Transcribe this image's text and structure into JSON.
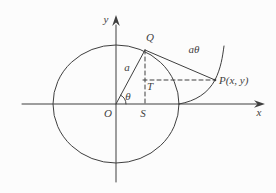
{
  "figure": {
    "background": "#fcfcfc",
    "ink_color": "#3f3f3f",
    "labels": {
      "y_axis": "y",
      "x_axis": "x",
      "point_Q": "Q",
      "arc_length": "aθ",
      "radius": "a",
      "angle": "θ",
      "origin": "O",
      "point_S": "S",
      "point_T": "T",
      "point_P": "P(x, y)"
    }
  }
}
